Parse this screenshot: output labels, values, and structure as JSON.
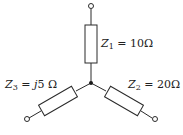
{
  "diagram": {
    "type": "wye-impedance-network",
    "junction": "center-node",
    "branches": [
      {
        "name": "Z1",
        "symbol": "Z",
        "subscript": "1",
        "equals": "=",
        "value": "10",
        "imag_prefix": "",
        "unit": "Ω",
        "position": "top"
      },
      {
        "name": "Z2",
        "symbol": "Z",
        "subscript": "2",
        "equals": "=",
        "value": "20",
        "imag_prefix": "",
        "unit": "Ω",
        "position": "bottom-right"
      },
      {
        "name": "Z3",
        "symbol": "Z",
        "subscript": "3",
        "equals": "=",
        "value": "5",
        "imag_prefix": "j",
        "unit": "Ω",
        "position": "bottom-left"
      }
    ]
  },
  "colors": {
    "line": "#2a2a2a",
    "background": "#ffffff"
  }
}
